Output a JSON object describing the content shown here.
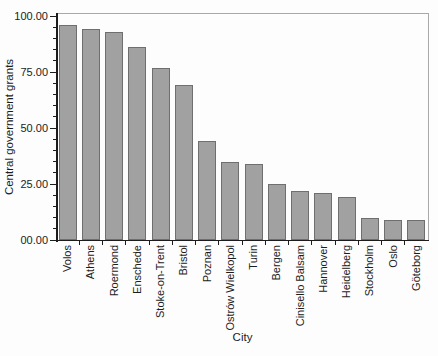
{
  "chart_data": {
    "type": "bar",
    "title": "",
    "xlabel": "City",
    "ylabel": "Central government grants",
    "categories": [
      "Volos",
      "Athens",
      "Roermond",
      "Enschede",
      "Stoke-on-Trent",
      "Bristol",
      "Poznan",
      "Ostrów Wielkopol",
      "Turin",
      "Bergen",
      "Cinisello Balsam",
      "Hannover",
      "Heidelberg",
      "Stockholm",
      "Oslo",
      "Göteborg"
    ],
    "values": [
      96,
      94,
      93,
      86,
      77,
      69,
      44,
      35,
      34,
      25,
      22,
      21,
      19,
      10,
      9,
      9
    ],
    "ylim": [
      0,
      100
    ],
    "y_ticks": {
      "values": [
        0,
        25,
        50,
        75,
        100
      ],
      "labels": [
        "00.00",
        "25.00",
        "50.00",
        "75.00",
        "100.00"
      ]
    },
    "y_minor_step": 5,
    "grid": "off",
    "legend": "none",
    "colors": {
      "bar_fill": "#a1a1a1",
      "bar_border": "#6f6f6f",
      "axis": "#1c1c1c",
      "frame": "#a9a9a9",
      "background": "#fdfdfd"
    }
  }
}
